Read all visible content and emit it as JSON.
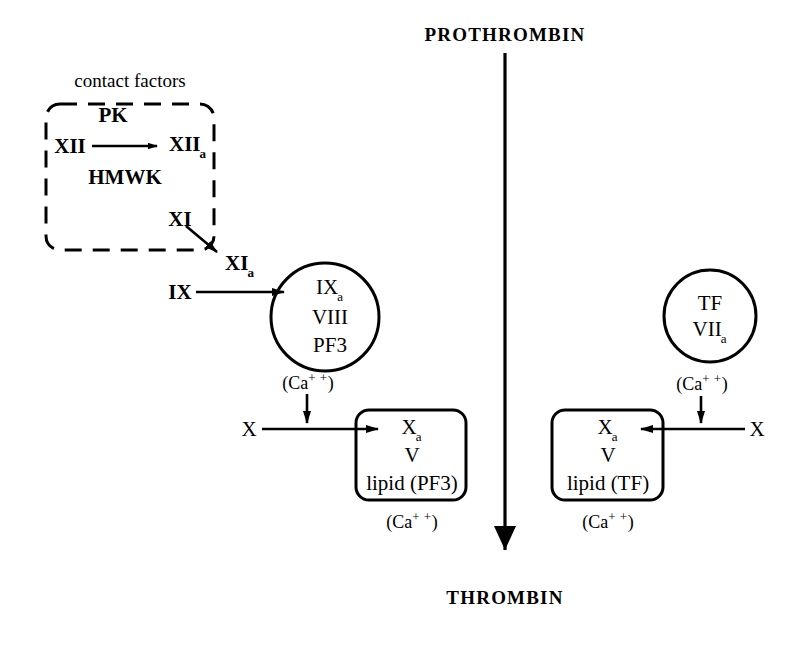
{
  "diagram": {
    "top_label": "PROTHROMBIN",
    "bottom_label": "THROMBIN",
    "colors": {
      "stroke": "#000000",
      "background": "#ffffff"
    }
  },
  "contact_box": {
    "caption": "contact factors",
    "cofactor_top": "PK",
    "cofactor_bottom": "HMWK",
    "substrate": "XII",
    "product": "XII",
    "product_sub": "a",
    "factor_xi": "XI"
  },
  "intrinsic": {
    "xi_activated": "XI",
    "xi_activated_sub": "a",
    "factor_ix": "IX",
    "circle": {
      "line1": "IX",
      "line1_sub": "a",
      "line2": "VIII",
      "line3": "PF3"
    },
    "circle_calcium": "(Ca",
    "circle_calcium_sup": "+ +",
    "circle_calcium_end": ")",
    "substrate_x": "X",
    "complex": {
      "line1": "X",
      "line1_sub": "a",
      "line2": "V",
      "line3": "lipid (PF3)"
    },
    "complex_calcium": "(Ca",
    "complex_calcium_sup": "+ +",
    "complex_calcium_end": ")"
  },
  "extrinsic": {
    "circle": {
      "line1": "TF",
      "line2": "VII",
      "line2_sub": "a"
    },
    "circle_calcium": "(Ca",
    "circle_calcium_sup": "+ +",
    "circle_calcium_end": ")",
    "substrate_x": "X",
    "complex": {
      "line1": "X",
      "line1_sub": "a",
      "line2": "V",
      "line3": "lipid (TF)"
    },
    "complex_calcium": "(Ca",
    "complex_calcium_sup": "+ +",
    "complex_calcium_end": ")"
  }
}
